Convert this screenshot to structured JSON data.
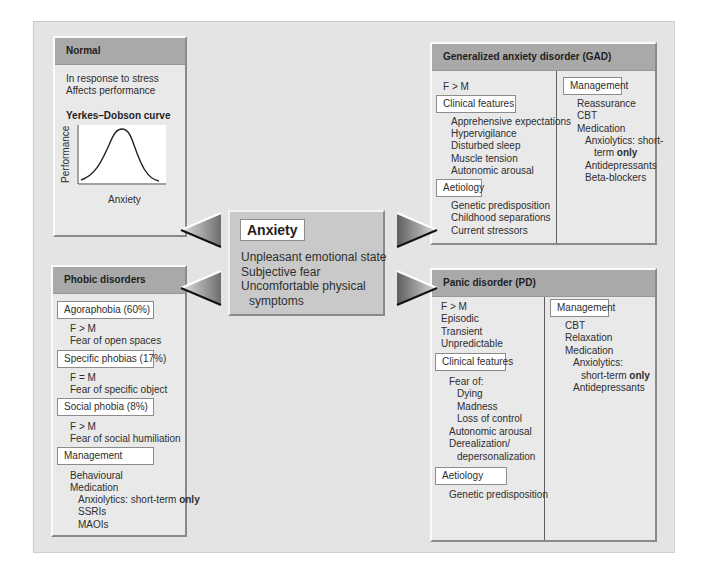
{
  "diagram": {
    "center": {
      "title": "Anxiety",
      "lines": [
        "Unpleasant emotional state",
        "Subjective fear",
        "Uncomfortable physical",
        "symptoms"
      ]
    },
    "normal": {
      "header": "Normal",
      "lines": [
        "In response to stress",
        "Affects performance"
      ],
      "chart_title": "Yerkes–Dobson curve",
      "y_axis_label": "Performance",
      "x_axis_label": "Anxiety"
    },
    "gad": {
      "header": "Generalized anxiety disorder (GAD)",
      "sex_ratio": "F > M",
      "clinical_label": "Clinical features",
      "clinical_items": [
        "Apprehensive expectations",
        "Hypervigilance",
        "Disturbed sleep",
        "Muscle tension",
        "Autonomic arousal"
      ],
      "aetiology_label": "Aetiology",
      "aetiology_items": [
        "Genetic predisposition",
        "Childhood separations",
        "Current stressors"
      ],
      "management_label": "Management",
      "management_items": [
        "Reassurance",
        "CBT",
        "Medication"
      ],
      "medication_items": [
        "Anxiolytics: short-",
        "term",
        "only",
        "Antidepressants",
        "Beta-blockers"
      ]
    },
    "phobic": {
      "header": "Phobic disorders",
      "agoraphobia_label": "Agoraphobia (60%)",
      "agoraphobia_items": [
        "F > M",
        "Fear of open spaces"
      ],
      "specific_label": "Specific phobias (17%)",
      "specific_items": [
        "F = M",
        "Fear of specific object"
      ],
      "social_label": "Social phobia (8%)",
      "social_items": [
        "F > M",
        "Fear of social humiliation"
      ],
      "management_label": "Management",
      "management_items": [
        "Behavioural",
        "Medication"
      ],
      "medication_items": [
        "Anxiolytics: short-term",
        "only",
        "SSRIs",
        "MAOIs"
      ]
    },
    "panic": {
      "header": "Panic disorder (PD)",
      "intro_items": [
        "F > M",
        "Episodic",
        "Transient",
        "Unpredictable"
      ],
      "clinical_label": "Clinical features",
      "fear_of": "Fear of:",
      "fear_items": [
        "Dying",
        "Madness",
        "Loss of control"
      ],
      "other_items": [
        "Autonomic arousal",
        "Derealization/",
        "depersonalization"
      ],
      "aetiology_label": "Aetiology",
      "aetiology_items": [
        "Genetic predisposition"
      ],
      "management_label": "Management",
      "management_items": [
        "CBT",
        "Relaxation",
        "Medication"
      ],
      "medication_items": [
        "Anxiolytics:",
        "short-term",
        "only",
        "Antidepressants"
      ]
    },
    "colors": {
      "panel_bg": "#e4e4e4",
      "box_bg": "#e9e9e9",
      "header_bg": "#a9a9a9",
      "center_bg": "#c9c9c9"
    }
  }
}
